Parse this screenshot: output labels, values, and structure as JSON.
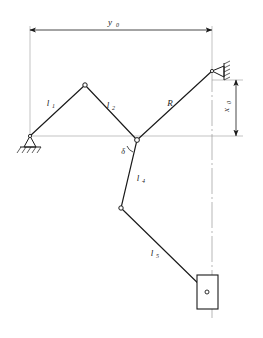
{
  "figure": {
    "type": "kinematic-linkage-diagram",
    "background_color": "#ffffff",
    "line_color": "#1a1a1a",
    "thin_line_color": "#8a8a8a",
    "labels": {
      "y0_main": "y",
      "y0_sub": "0",
      "x0_main": "x",
      "x0_sub": "0",
      "l1_main": "l",
      "l1_sub": "1",
      "l2_main": "l",
      "l2_sub": "2",
      "R_main": "R",
      "l4_main": "l",
      "l4_sub": "4",
      "l5_main": "l",
      "l5_sub": "5",
      "delta": "δ"
    },
    "nodes": {
      "ground_pivot": {
        "x": 30,
        "y": 136
      },
      "apex_joint": {
        "x": 85,
        "y": 85
      },
      "center_joint": {
        "x": 137,
        "y": 140
      },
      "upper_right_pivot": {
        "x": 212,
        "y": 71
      },
      "lower_joint": {
        "x": 121,
        "y": 208
      },
      "slider_joint": {
        "x": 207,
        "y": 292
      }
    },
    "dimensions": {
      "y0_line": {
        "x1": 30,
        "x2": 212,
        "y": 30
      },
      "x0_line": {
        "x": 236,
        "y1": 80,
        "y2": 136
      },
      "baseline_y": 136
    }
  }
}
